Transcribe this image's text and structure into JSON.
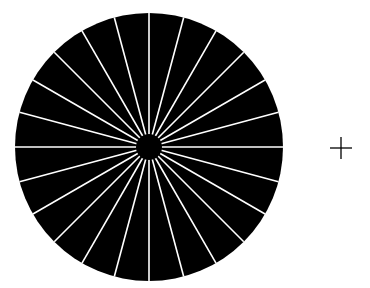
{
  "diagram": {
    "type": "radial-line-chart",
    "background": "#ffffff",
    "disc": {
      "center": [
        149,
        147
      ],
      "radius": 134,
      "fill": "#000000"
    },
    "spokes": {
      "count": 24,
      "angle_step_deg": 15,
      "color": "#ffffff",
      "width": 1.6
    },
    "hub": {
      "radius": 13,
      "fill": "#000000"
    },
    "fixation_cross": {
      "center": [
        341,
        148
      ],
      "half_length": 11,
      "color": "#000000",
      "width": 1.3
    }
  }
}
